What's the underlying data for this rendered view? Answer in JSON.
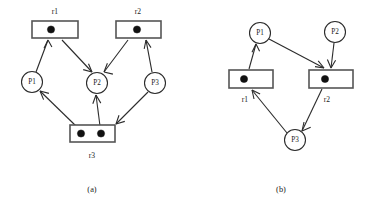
{
  "figure": {
    "background_color": "#ffffff",
    "ink_color": "#2b2b2b",
    "token_color": "#111111",
    "panels": [
      {
        "id": "panel-a",
        "caption": "(a)",
        "caption_pos": {
          "x": 92,
          "y": 190
        },
        "transitions": [
          {
            "id": "a-r1",
            "label": "r1",
            "x": 32,
            "y": 21,
            "w": 46,
            "h": 17,
            "label_pos": {
              "x": 55,
              "y": 12
            },
            "tokens": [
              {
                "cx": 51,
                "cy": 29.5,
                "r": 3.6
              }
            ]
          },
          {
            "id": "a-r2",
            "label": "r2",
            "x": 116,
            "y": 21,
            "w": 45,
            "h": 17,
            "label_pos": {
              "x": 138,
              "y": 12
            },
            "tokens": [
              {
                "cx": 137,
                "cy": 29.5,
                "r": 3.6
              }
            ]
          },
          {
            "id": "a-r3",
            "label": "r3",
            "x": 70,
            "y": 125,
            "w": 45,
            "h": 17,
            "label_pos": {
              "x": 92,
              "y": 156
            },
            "tokens": [
              {
                "cx": 81,
                "cy": 133.5,
                "r": 3.6
              },
              {
                "cx": 101,
                "cy": 133.5,
                "r": 3.6
              }
            ]
          }
        ],
        "places": [
          {
            "id": "a-p1",
            "label": "P1",
            "cx": 32,
            "cy": 82,
            "r": 10.5
          },
          {
            "id": "a-p2",
            "label": "P2",
            "cx": 97,
            "cy": 83,
            "r": 10.5
          },
          {
            "id": "a-p3",
            "label": "P3",
            "cx": 155,
            "cy": 83,
            "r": 10.5
          }
        ],
        "arcs": [
          {
            "id": "a-arc-p1-r1",
            "from": "P1",
            "to": "r1",
            "x1": 36,
            "y1": 72,
            "x2": 48,
            "y2": 40
          },
          {
            "id": "a-arc-r1-p2",
            "from": "r1",
            "to": "P2",
            "x1": 62,
            "y1": 40,
            "x2": 92,
            "y2": 72
          },
          {
            "id": "a-arc-p3-r2",
            "from": "P3",
            "to": "r2",
            "x1": 152,
            "y1": 72,
            "x2": 146,
            "y2": 40
          },
          {
            "id": "a-arc-r2-p2",
            "from": "r2",
            "to": "P2",
            "x1": 128,
            "y1": 40,
            "x2": 104,
            "y2": 72
          },
          {
            "id": "a-arc-r3-p1",
            "from": "r3",
            "to": "P1",
            "x1": 76,
            "y1": 126,
            "x2": 40,
            "y2": 91
          },
          {
            "id": "a-arc-r3-p2",
            "from": "r3",
            "to": "P2",
            "x1": 100,
            "y1": 126,
            "x2": 96,
            "y2": 95
          },
          {
            "id": "a-arc-p3-r3",
            "from": "P3",
            "to": "r3",
            "x1": 148,
            "y1": 92,
            "x2": 116,
            "y2": 124
          }
        ]
      },
      {
        "id": "panel-b",
        "caption": "(b)",
        "caption_pos": {
          "x": 281,
          "y": 190
        },
        "transitions": [
          {
            "id": "b-r1",
            "label": "r1",
            "x": 229,
            "y": 70,
            "w": 44,
            "h": 18,
            "label_pos": {
              "x": 245,
              "y": 100
            },
            "tokens": [
              {
                "cx": 244,
                "cy": 79,
                "r": 3.6
              }
            ]
          },
          {
            "id": "b-r2",
            "label": "r2",
            "x": 309,
            "y": 70,
            "w": 44,
            "h": 18,
            "label_pos": {
              "x": 327,
              "y": 100
            },
            "tokens": [
              {
                "cx": 325,
                "cy": 79,
                "r": 3.6
              }
            ]
          }
        ],
        "places": [
          {
            "id": "b-p1",
            "label": "P1",
            "cx": 260,
            "cy": 33,
            "r": 10.5
          },
          {
            "id": "b-p2",
            "label": "P2",
            "cx": 335,
            "cy": 32,
            "r": 10.5
          },
          {
            "id": "b-p3",
            "label": "P3",
            "cx": 295,
            "cy": 140,
            "r": 10.5
          }
        ],
        "arcs": [
          {
            "id": "b-arc-r1-p1",
            "from": "r1",
            "to": "P1",
            "x1": 249,
            "y1": 69,
            "x2": 256,
            "y2": 44
          },
          {
            "id": "b-arc-p1-r2",
            "from": "P1",
            "to": "r2",
            "x1": 269,
            "y1": 39,
            "x2": 324,
            "y2": 68
          },
          {
            "id": "b-arc-p2-r2",
            "from": "P2",
            "to": "r2",
            "x1": 334,
            "y1": 43,
            "x2": 331,
            "y2": 68
          },
          {
            "id": "b-arc-r2-p3",
            "from": "r2",
            "to": "P3",
            "x1": 322,
            "y1": 89,
            "x2": 302,
            "y2": 131
          },
          {
            "id": "b-arc-p3-r1",
            "from": "P3",
            "to": "r1",
            "x1": 287,
            "y1": 133,
            "x2": 252,
            "y2": 90
          }
        ]
      }
    ]
  }
}
